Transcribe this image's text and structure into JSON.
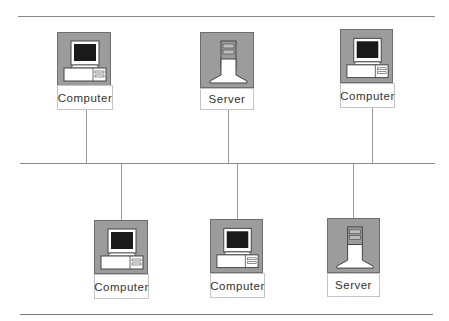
{
  "diagram": {
    "type": "network-bus-topology",
    "colors": {
      "icon_bg": "#9c9c9c",
      "line": "#8a8a8a",
      "screen": "#1a1a1a"
    },
    "top_row": [
      {
        "label": "Computer",
        "kind": "computer"
      },
      {
        "label": "Server",
        "kind": "server"
      },
      {
        "label": "Computer",
        "kind": "computer"
      }
    ],
    "bottom_row": [
      {
        "label": "Computer",
        "kind": "computer"
      },
      {
        "label": "Computer",
        "kind": "computer"
      },
      {
        "label": "Server",
        "kind": "server"
      }
    ]
  }
}
